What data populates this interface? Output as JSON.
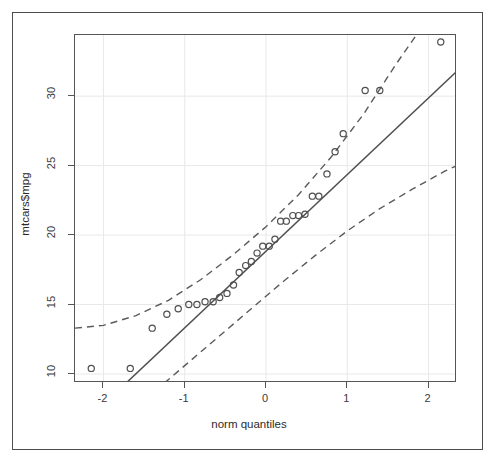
{
  "figure": {
    "background_color": "#ffffff",
    "frame_color": "#4c4c4c",
    "plot_border_color": "#555555",
    "grid_color": "#e8e8e8",
    "point_color": "#4f4f4f",
    "line_color": "#4f4f4f",
    "band_color": "#5a5a5a"
  },
  "chart_data": {
    "type": "scatter",
    "title": "",
    "subtitle": "",
    "xlabel": "norm quantiles",
    "ylabel": "mtcars$mpg",
    "xlim": [
      -2.35,
      2.35
    ],
    "ylim": [
      9.35,
      34.4
    ],
    "xticks": [
      -2,
      -1,
      0,
      1,
      2
    ],
    "xticklabels": [
      "-2",
      "-1",
      "0",
      "1",
      "2"
    ],
    "yticks": [
      10,
      15,
      20,
      25,
      30
    ],
    "yticklabels": [
      "10",
      "15",
      "20",
      "25",
      "30"
    ],
    "grid": true,
    "legend": null,
    "series": [
      {
        "name": "sample quantiles",
        "marker": "open-circle",
        "x": [
          -2.15,
          -1.67,
          -1.4,
          -1.22,
          -1.08,
          -0.95,
          -0.85,
          -0.75,
          -0.65,
          -0.57,
          -0.48,
          -0.4,
          -0.33,
          -0.25,
          -0.18,
          -0.11,
          -0.04,
          0.04,
          0.11,
          0.18,
          0.25,
          0.33,
          0.4,
          0.48,
          0.57,
          0.65,
          0.75,
          0.85,
          0.95,
          1.22,
          1.4,
          2.15
        ],
        "y": [
          10.4,
          10.4,
          13.3,
          14.3,
          14.7,
          15.0,
          15.0,
          15.2,
          15.2,
          15.5,
          15.8,
          16.4,
          17.3,
          17.8,
          18.1,
          18.7,
          19.2,
          19.2,
          19.7,
          21.0,
          21.0,
          21.4,
          21.4,
          21.5,
          22.8,
          22.8,
          24.4,
          26.0,
          27.3,
          30.4,
          30.4,
          33.9
        ]
      }
    ],
    "reference_line": {
      "name": "qq-reference-line",
      "style": "solid",
      "x": [
        -1.72,
        2.35
      ],
      "y": [
        9.35,
        31.8
      ]
    },
    "confidence_band_upper": {
      "name": "upper-confidence-band",
      "style": "dashed",
      "x": [
        -2.35,
        -2.0,
        -1.6,
        -1.2,
        -0.8,
        -0.4,
        0.0,
        0.4,
        0.8,
        1.2,
        1.6,
        1.85
      ],
      "y": [
        13.3,
        13.5,
        14.2,
        15.3,
        16.8,
        18.6,
        20.6,
        22.9,
        25.6,
        28.7,
        32.3,
        34.4
      ]
    },
    "confidence_band_lower": {
      "name": "lower-confidence-band",
      "style": "dashed",
      "x": [
        -1.25,
        -1.0,
        -0.6,
        -0.2,
        0.2,
        0.6,
        1.0,
        1.4,
        1.8,
        2.2,
        2.35
      ],
      "y": [
        9.35,
        10.6,
        12.6,
        14.6,
        16.6,
        18.5,
        20.3,
        21.9,
        23.3,
        24.6,
        25.0
      ]
    }
  }
}
